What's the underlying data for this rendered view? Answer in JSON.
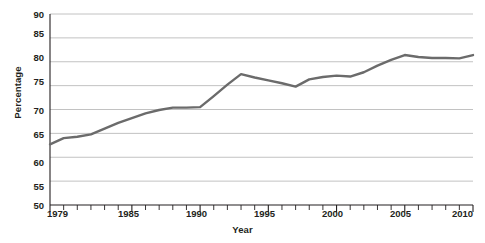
{
  "chart_data": {
    "type": "line",
    "title": "",
    "xlabel": "Year",
    "ylabel": "Percentage",
    "xlim": [
      1979,
      2010
    ],
    "ylim": [
      50,
      90
    ],
    "ytick_labels": [
      "90",
      "85",
      "80",
      "75",
      "70",
      "65",
      "60",
      "55",
      "50"
    ],
    "ytick_values": [
      90,
      85,
      80,
      75,
      70,
      65,
      60,
      55,
      50
    ],
    "xtick_labels": [
      "1979",
      "1985",
      "1990",
      "1995",
      "2000",
      "2005",
      "2010"
    ],
    "xtick_values": [
      1979,
      1985,
      1990,
      1995,
      2000,
      2005,
      2010
    ],
    "minor_xticks_every": 1,
    "grid": "horizontal",
    "legend": "none",
    "line_color": "#6b6b6b",
    "axis_color": "#231f20",
    "grid_color": "#b3b3b3",
    "series": [
      {
        "name": "Percentage",
        "x": [
          1979,
          1980,
          1981,
          1982,
          1983,
          1984,
          1985,
          1986,
          1987,
          1988,
          1989,
          1990,
          1991,
          1992,
          1993,
          1994,
          1995,
          1996,
          1997,
          1998,
          1999,
          2000,
          2001,
          2002,
          2003,
          2004,
          2005,
          2006,
          2007,
          2008,
          2009,
          2010
        ],
        "values": [
          62.7,
          64.0,
          64.3,
          64.8,
          66.0,
          67.2,
          68.2,
          69.2,
          69.9,
          70.4,
          70.4,
          70.5,
          72.8,
          75.2,
          77.4,
          76.7,
          76.1,
          75.5,
          74.8,
          76.3,
          76.8,
          77.1,
          76.9,
          77.8,
          79.2,
          80.4,
          81.4,
          81.0,
          80.8,
          80.8,
          80.7,
          81.4
        ]
      }
    ]
  }
}
